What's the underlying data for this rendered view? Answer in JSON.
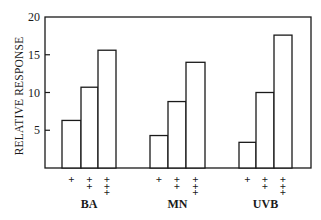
{
  "chart_data": {
    "type": "bar",
    "title": "",
    "xlabel": "",
    "ylabel": "RELATIVE RESPONSE",
    "ylim": [
      0,
      20
    ],
    "yticks": [
      5,
      10,
      15,
      20
    ],
    "grid": false,
    "legend": null,
    "categories": [
      "BA",
      "MN",
      "UVB"
    ],
    "subgroup_markers": [
      "+",
      "++",
      "+++"
    ],
    "series": [
      {
        "name": "+",
        "values": [
          6.3,
          4.3,
          3.4
        ]
      },
      {
        "name": "++",
        "values": [
          10.7,
          8.8,
          10.0
        ]
      },
      {
        "name": "+++",
        "values": [
          15.6,
          14.0,
          17.6
        ]
      }
    ]
  },
  "colors": {
    "ink": "#1a1a1a",
    "bar_fill": "#ffffff",
    "background": "#ffffff"
  },
  "layout": {
    "plot_left": 45,
    "plot_right": 311,
    "plot_top": 17,
    "plot_bottom": 168,
    "group_bar_x": [
      [
        [
          62,
          81
        ],
        [
          81,
          98
        ],
        [
          98,
          116
        ]
      ],
      [
        [
          150,
          168
        ],
        [
          168,
          186
        ],
        [
          186,
          205
        ]
      ],
      [
        [
          239,
          256
        ],
        [
          256,
          274
        ],
        [
          274,
          292
        ]
      ]
    ]
  }
}
